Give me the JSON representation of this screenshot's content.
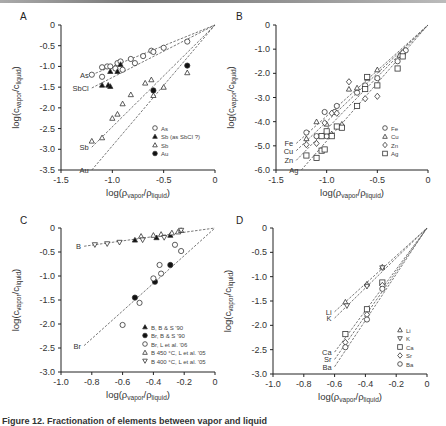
{
  "figure": {
    "caption": "Figure 12. Fractionation of elements between vapor and liquid"
  },
  "chart_data": [
    {
      "panel": "A",
      "type": "scatter",
      "xlabel": "log(ρvapor/ρliquid)",
      "ylabel": "log(cvapor/cliquid)",
      "xlim": [
        -1.5,
        0
      ],
      "ylim": [
        -3.5,
        0
      ],
      "xticks": [
        "-1.5",
        "-1.0",
        "-0.5",
        "0"
      ],
      "yticks": [
        "0",
        "-0.5",
        "-1.0",
        "-1.5",
        "-2.0",
        "-2.5",
        "-3.0",
        "-3.5"
      ],
      "grid": false,
      "legend_position": "lower right",
      "lines": [
        {
          "label": "As",
          "start": [
            -1.2,
            -1.2
          ],
          "end": [
            0,
            0
          ]
        },
        {
          "label": "SbCl",
          "start": [
            -1.2,
            -1.52
          ],
          "end": [
            0,
            0
          ]
        },
        {
          "label": "Sb",
          "start": [
            -1.2,
            -2.95
          ],
          "end": [
            0,
            0
          ]
        },
        {
          "label": "Au",
          "start": [
            -1.2,
            -3.5
          ],
          "end": [
            0,
            0
          ]
        }
      ],
      "series": [
        {
          "name": "As",
          "marker": "circle-open",
          "points": [
            [
              -1.2,
              -1.2
            ],
            [
              -1.1,
              -1.02
            ],
            [
              -1.1,
              -1.25
            ],
            [
              -1.05,
              -1.0
            ],
            [
              -1.02,
              -1.0
            ],
            [
              -0.97,
              -1.05
            ],
            [
              -0.95,
              -0.92
            ],
            [
              -0.92,
              -0.88
            ],
            [
              -0.9,
              -1.08
            ],
            [
              -0.82,
              -0.82
            ],
            [
              -0.78,
              -0.92
            ],
            [
              -0.7,
              -0.75
            ],
            [
              -0.62,
              -0.62
            ],
            [
              -0.6,
              -0.65
            ],
            [
              -0.5,
              -0.55
            ],
            [
              -0.27,
              -0.4
            ]
          ]
        },
        {
          "name": "Sb (as SbCl ?)",
          "marker": "triangle-filled",
          "points": [
            [
              -1.1,
              -1.45
            ],
            [
              -1.04,
              -1.45
            ],
            [
              -1.02,
              -1.48
            ],
            [
              -1.02,
              -1.12
            ],
            [
              -0.95,
              -1.12
            ],
            [
              -0.92,
              -0.95
            ]
          ]
        },
        {
          "name": "Sb",
          "marker": "triangle-open",
          "points": [
            [
              -1.2,
              -2.8
            ],
            [
              -1.1,
              -2.72
            ],
            [
              -1.0,
              -2.25
            ],
            [
              -0.95,
              -2.15
            ],
            [
              -0.9,
              -1.9
            ],
            [
              -0.82,
              -1.68
            ],
            [
              -0.68,
              -1.4
            ],
            [
              -0.62,
              -1.32
            ],
            [
              -0.6,
              -1.7
            ],
            [
              -0.5,
              -1.5
            ],
            [
              -0.27,
              -1.15
            ]
          ]
        },
        {
          "name": "Au",
          "marker": "circle-filled",
          "points": [
            [
              -0.6,
              -1.58
            ],
            [
              -0.27,
              -0.98
            ]
          ]
        }
      ]
    },
    {
      "panel": "B",
      "type": "scatter",
      "xlabel": "log(ρvapor/ρliquid)",
      "ylabel": "log(cvapor/cliquid)",
      "xlim": [
        -1.5,
        0
      ],
      "ylim": [
        -6.0,
        0
      ],
      "xticks": [
        "-1.5",
        "-1.0",
        "-0.5",
        "0"
      ],
      "yticks": [
        "0",
        "-1.0",
        "-2.0",
        "-3.0",
        "-4.0",
        "-5.0",
        "-6.0"
      ],
      "grid": false,
      "legend_position": "lower right",
      "lines": [
        {
          "label": "Fe",
          "start": [
            -1.3,
            -4.9
          ],
          "end": [
            0,
            0
          ]
        },
        {
          "label": "Cu",
          "start": [
            -1.3,
            -5.2
          ],
          "end": [
            0,
            0
          ]
        },
        {
          "label": "Zn",
          "start": [
            -1.3,
            -5.6
          ],
          "end": [
            0,
            0
          ]
        },
        {
          "label": "Ag",
          "start": [
            -1.25,
            -6.0
          ],
          "end": [
            0,
            0
          ]
        }
      ],
      "series": [
        {
          "name": "Fe",
          "marker": "circle-open",
          "points": [
            [
              -1.2,
              -4.45
            ],
            [
              -1.1,
              -4.6
            ],
            [
              -1.02,
              -3.6
            ],
            [
              -1.0,
              -4.6
            ],
            [
              -0.92,
              -3.6
            ],
            [
              -0.9,
              -3.35
            ],
            [
              -0.7,
              -2.8
            ],
            [
              -0.62,
              -2.5
            ],
            [
              -0.5,
              -2.2
            ],
            [
              -0.3,
              -1.5
            ],
            [
              -0.25,
              -1.2
            ],
            [
              -0.22,
              -1.05
            ]
          ]
        },
        {
          "name": "Cu",
          "marker": "triangle-open",
          "points": [
            [
              -1.2,
              -4.7
            ],
            [
              -1.1,
              -4.0
            ],
            [
              -1.0,
              -4.1
            ],
            [
              -0.95,
              -4.5
            ],
            [
              -0.85,
              -4.1
            ],
            [
              -0.78,
              -2.65
            ],
            [
              -0.7,
              -2.6
            ],
            [
              -0.6,
              -2.2
            ],
            [
              -0.5,
              -1.85
            ],
            [
              -0.28,
              -1.25
            ]
          ]
        },
        {
          "name": "Zn",
          "marker": "diamond-open",
          "points": [
            [
              -1.2,
              -4.95
            ],
            [
              -1.1,
              -4.9
            ],
            [
              -1.02,
              -4.05
            ],
            [
              -0.95,
              -3.65
            ],
            [
              -0.9,
              -3.65
            ],
            [
              -0.78,
              -2.35
            ],
            [
              -0.62,
              -3.05
            ],
            [
              -0.5,
              -2.95
            ],
            [
              -0.25,
              -1.15
            ]
          ]
        },
        {
          "name": "Ag",
          "marker": "square-open",
          "points": [
            [
              -1.2,
              -5.4
            ],
            [
              -1.1,
              -5.5
            ],
            [
              -1.05,
              -5.2
            ],
            [
              -1.02,
              -5.15
            ],
            [
              -1.05,
              -4.6
            ],
            [
              -1.0,
              -4.4
            ],
            [
              -0.95,
              -4.6
            ],
            [
              -0.9,
              -4.2
            ],
            [
              -0.85,
              -4.25
            ],
            [
              -0.7,
              -3.35
            ],
            [
              -0.62,
              -2.65
            ],
            [
              -0.6,
              -2.15
            ],
            [
              -0.5,
              -2.5
            ],
            [
              -0.3,
              -1.8
            ],
            [
              -0.25,
              -1.3
            ]
          ]
        }
      ]
    },
    {
      "panel": "C",
      "type": "scatter",
      "xlabel": "log(ρvapor/ρliquid)",
      "ylabel": "log(cvapor/cliquid)",
      "xlim": [
        -1.0,
        0
      ],
      "ylim": [
        -3.0,
        0
      ],
      "xticks": [
        "-1.0",
        "-0.8",
        "-0.6",
        "-0.4",
        "-0.2",
        "0"
      ],
      "yticks": [
        "0",
        "-0.5",
        "-1.0",
        "-1.5",
        "-2.0",
        "-2.5",
        "-3.0"
      ],
      "grid": false,
      "legend_position": "lower right",
      "lines": [
        {
          "label": "B",
          "start": [
            -0.85,
            -0.38
          ],
          "end": [
            0,
            0
          ]
        },
        {
          "label": "Br",
          "start": [
            -0.85,
            -2.45
          ],
          "end": [
            0,
            0
          ]
        }
      ],
      "series": [
        {
          "name": "B, B & S '90",
          "marker": "triangle-filled",
          "points": [
            [
              -0.52,
              -0.25
            ],
            [
              -0.38,
              -0.2
            ],
            [
              -0.29,
              -0.15
            ]
          ]
        },
        {
          "name": "Br, B & S '90",
          "marker": "circle-filled",
          "points": [
            [
              -0.52,
              -1.45
            ],
            [
              -0.39,
              -1.12
            ],
            [
              -0.29,
              -0.77
            ]
          ]
        },
        {
          "name": "Br, L et al. '06",
          "marker": "circle-open",
          "points": [
            [
              -0.6,
              -2.02
            ],
            [
              -0.49,
              -1.56
            ],
            [
              -0.4,
              -1.05
            ],
            [
              -0.36,
              -0.77
            ],
            [
              -0.35,
              -0.95
            ],
            [
              -0.26,
              -0.35
            ],
            [
              -0.22,
              -0.48
            ]
          ]
        },
        {
          "name": "B 450 °C, L et al. '05",
          "marker": "triangle-open",
          "points": [
            [
              -0.48,
              -0.17
            ],
            [
              -0.4,
              -0.15
            ],
            [
              -0.35,
              -0.13
            ],
            [
              -0.28,
              -0.1
            ],
            [
              -0.24,
              -0.08
            ],
            [
              -0.22,
              -0.05
            ]
          ]
        },
        {
          "name": "B 400 °C, L et al. '05",
          "marker": "triangle-down-open",
          "points": [
            [
              -0.78,
              -0.35
            ],
            [
              -0.7,
              -0.33
            ],
            [
              -0.62,
              -0.3
            ],
            [
              -0.47,
              -0.25
            ],
            [
              -0.33,
              -0.2
            ],
            [
              -0.22,
              -0.05
            ]
          ]
        }
      ]
    },
    {
      "panel": "D",
      "type": "scatter",
      "xlabel": "log(ρvapor/ρliquid)",
      "ylabel": "log(cvapor/cliquid)",
      "xlim": [
        -1.0,
        0
      ],
      "ylim": [
        -3.0,
        0
      ],
      "xticks": [
        "-1.0",
        "-0.8",
        "-0.6",
        "-0.4",
        "-0.2",
        "0"
      ],
      "yticks": [
        "0",
        "-0.5",
        "-1.0",
        "-1.5",
        "-2.0",
        "-2.5",
        "-3.0"
      ],
      "grid": false,
      "legend_position": "lower right",
      "lines": [
        {
          "label": "Li",
          "start": [
            -0.6,
            -1.72
          ],
          "end": [
            0,
            0
          ]
        },
        {
          "label": "K",
          "start": [
            -0.6,
            -1.85
          ],
          "end": [
            0,
            0
          ]
        },
        {
          "label": "Ca",
          "start": [
            -0.6,
            -2.55
          ],
          "end": [
            0,
            0
          ]
        },
        {
          "label": "Sr",
          "start": [
            -0.6,
            -2.7
          ],
          "end": [
            0,
            0
          ]
        },
        {
          "label": "Ba",
          "start": [
            -0.6,
            -2.85
          ],
          "end": [
            0,
            0
          ]
        }
      ],
      "series": [
        {
          "name": "Li",
          "marker": "triangle-open",
          "points": [
            [
              -0.53,
              -1.52
            ],
            [
              -0.39,
              -1.15
            ],
            [
              -0.29,
              -0.8
            ]
          ]
        },
        {
          "name": "K",
          "marker": "triangle-down-open",
          "points": [
            [
              -0.52,
              -1.6
            ],
            [
              -0.39,
              -1.2
            ],
            [
              -0.29,
              -0.82
            ]
          ]
        },
        {
          "name": "Ca",
          "marker": "square-open",
          "points": [
            [
              -0.53,
              -2.18
            ],
            [
              -0.39,
              -1.67
            ],
            [
              -0.29,
              -1.12
            ]
          ]
        },
        {
          "name": "Sr",
          "marker": "diamond-open",
          "points": [
            [
              -0.53,
              -2.35
            ],
            [
              -0.39,
              -1.78
            ],
            [
              -0.29,
              -1.18
            ]
          ]
        },
        {
          "name": "Ba",
          "marker": "circle-open",
          "points": [
            [
              -0.53,
              -2.45
            ],
            [
              -0.39,
              -1.88
            ],
            [
              -0.29,
              -1.25
            ]
          ]
        }
      ]
    }
  ]
}
